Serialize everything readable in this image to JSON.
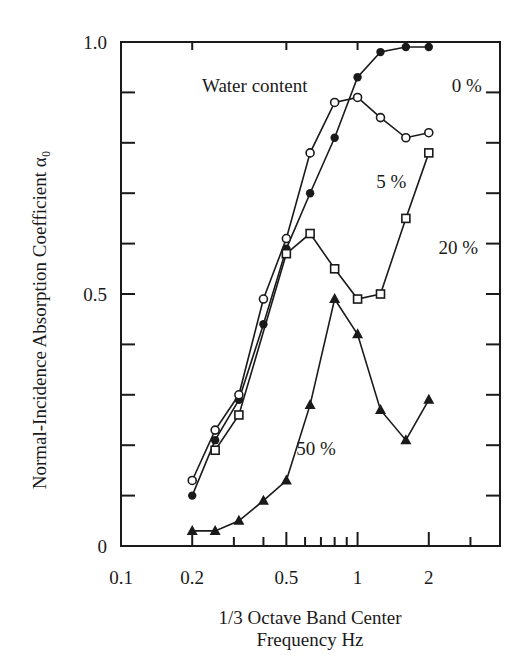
{
  "chart_data": {
    "type": "line",
    "title": "",
    "xlabel": "1/3 Octave Band Center Frequency Hz",
    "xlabel_lines": [
      "1/3 Octave Band Center",
      "Frequency Hz"
    ],
    "ylabel": "Normal-Incidence Absorption Coefficient α₀",
    "xscale": "log",
    "xlim": [
      0.1,
      4
    ],
    "ylim": [
      0,
      1.0
    ],
    "x_ticks": [
      0.1,
      0.2,
      0.5,
      1,
      2
    ],
    "x_tick_labels": [
      "0.1",
      "0.2",
      "0.5",
      "1",
      "2"
    ],
    "x_minor_ticks": [
      0.3,
      0.4,
      0.6,
      0.7,
      0.8,
      0.9,
      3
    ],
    "y_ticks": [
      0,
      0.5,
      1.0
    ],
    "y_tick_labels": [
      "0",
      "0.5",
      "1.0"
    ],
    "y_minor_ticks": [
      0.1,
      0.2,
      0.3,
      0.4,
      0.6,
      0.7,
      0.8,
      0.9
    ],
    "grid": false,
    "legend_title": "Water content",
    "x": [
      0.2,
      0.25,
      0.315,
      0.4,
      0.5,
      0.63,
      0.8,
      1.0,
      1.25,
      1.6,
      2.0
    ],
    "series": [
      {
        "name": "0 %",
        "marker": "filled-circle",
        "values": [
          0.1,
          0.21,
          0.29,
          0.44,
          0.59,
          0.7,
          0.81,
          0.93,
          0.98,
          0.99,
          0.99
        ]
      },
      {
        "name": "5 %",
        "marker": "open-circle",
        "values": [
          0.13,
          0.23,
          0.3,
          0.49,
          0.61,
          0.78,
          0.88,
          0.89,
          0.85,
          0.81,
          0.82
        ]
      },
      {
        "name": "20 %",
        "marker": "open-square",
        "values": [
          null,
          0.19,
          0.26,
          null,
          0.58,
          0.62,
          0.55,
          0.49,
          0.5,
          0.65,
          0.78
        ]
      },
      {
        "name": "50 %",
        "marker": "filled-triangle",
        "values": [
          0.03,
          0.03,
          0.05,
          0.09,
          0.13,
          0.28,
          0.49,
          0.42,
          0.27,
          0.21,
          0.29
        ]
      }
    ],
    "annotations": [
      {
        "text": "Water content",
        "x": 0.22,
        "y": 0.9
      },
      {
        "text": "0 %",
        "x": 2.5,
        "y": 0.9
      },
      {
        "text": "5 %",
        "x": 1.2,
        "y": 0.71
      },
      {
        "text": "20 %",
        "x": 2.2,
        "y": 0.58
      },
      {
        "text": "50 %",
        "x": 0.55,
        "y": 0.18
      }
    ]
  }
}
